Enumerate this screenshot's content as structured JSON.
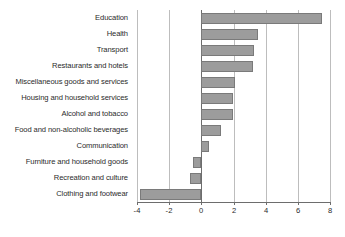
{
  "chart_data": {
    "type": "bar",
    "orientation": "horizontal",
    "title": "",
    "subtitle": "",
    "xlabel": "",
    "ylabel": "",
    "xlim": [
      -4,
      8
    ],
    "xticks": [
      -4,
      -2,
      0,
      2,
      4,
      6,
      8
    ],
    "xtick_labels": [
      "-4",
      "-2",
      "0",
      "2",
      "4",
      "6",
      "8"
    ],
    "grid": true,
    "grid_axis": "x",
    "legend": false,
    "legend_position": "none",
    "bar_color": "#9c9c9c",
    "bar_border_color": "#7a7a7a",
    "zero_line_color": "#6d6d6d",
    "gridline_color": "#bdbdbd",
    "categories": [
      "Education",
      "Health",
      "Transport",
      "Restaurants and hotels",
      "Miscellaneous goods and services",
      "Housing and household services",
      "Alcohol and tobacco",
      "Food and non-alcoholic beverages",
      "Communication",
      "Furniture and household goods",
      "Recreation and culture",
      "Clothing and footwear"
    ],
    "values": [
      7.5,
      3.5,
      3.3,
      3.2,
      2.1,
      1.95,
      1.95,
      1.2,
      0.5,
      -0.5,
      -0.7,
      -3.8
    ]
  }
}
